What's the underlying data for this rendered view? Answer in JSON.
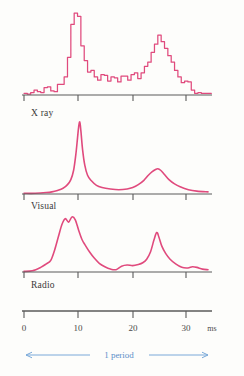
{
  "figure": {
    "curve_color": "#e04a7d",
    "axis_color": "#5a5a5a",
    "period_color": "#7aa9d9",
    "background": "#fdfdfb"
  },
  "axis": {
    "unit_label": "ms",
    "tick_labels": [
      "0",
      "10",
      "20",
      "30"
    ],
    "tick_values": [
      0,
      10,
      20,
      30
    ],
    "min": 0,
    "max": 33
  },
  "period": {
    "label": "1 period",
    "start_ms": 0,
    "end_ms": 33
  },
  "panels": [
    {
      "label": "X ray",
      "style": "step"
    },
    {
      "label": "Visual",
      "style": "smooth"
    },
    {
      "label": "Radio",
      "style": "smooth"
    }
  ],
  "chart_data": {
    "type": "line",
    "xlabel": "ms",
    "ylabel": "",
    "xlim": [
      0,
      33
    ],
    "grid": false,
    "legend": "none",
    "annotations": [
      "1 period"
    ],
    "series": [
      {
        "name": "X ray",
        "plot_style": "step",
        "x": [
          0,
          0.6,
          1.2,
          1.8,
          2.4,
          3.0,
          3.6,
          4.2,
          4.8,
          5.4,
          6.0,
          6.6,
          7.2,
          7.8,
          8.4,
          9.0,
          9.6,
          10.2,
          10.8,
          11.4,
          12.0,
          12.6,
          13.2,
          13.8,
          14.4,
          15.0,
          15.6,
          16.2,
          16.8,
          17.4,
          18.0,
          18.6,
          19.2,
          19.8,
          20.4,
          21.0,
          21.6,
          22.2,
          22.8,
          23.4,
          24.0,
          24.6,
          25.2,
          25.8,
          26.4,
          27.0,
          27.6,
          28.2,
          28.8,
          29.4,
          30.0,
          30.6,
          31.2,
          31.8,
          32.4,
          33.0
        ],
        "y": [
          2,
          1,
          3,
          6,
          4,
          3,
          9,
          10,
          5,
          4,
          13,
          13,
          22,
          46,
          86,
          100,
          96,
          60,
          42,
          28,
          30,
          22,
          18,
          25,
          24,
          17,
          22,
          21,
          16,
          23,
          23,
          18,
          25,
          27,
          20,
          27,
          35,
          40,
          52,
          62,
          73,
          65,
          57,
          48,
          40,
          30,
          22,
          15,
          17,
          16,
          6,
          2,
          3,
          2,
          2,
          2
        ]
      },
      {
        "name": "Visual",
        "plot_style": "smooth",
        "x": [
          0,
          2,
          4,
          5,
          6,
          7,
          7.8,
          8.4,
          8.9,
          9.3,
          9.6,
          9.8,
          10.0,
          10.2,
          10.5,
          10.9,
          11.4,
          12.0,
          13.0,
          14.0,
          15.5,
          17.0,
          18.5,
          19.5,
          20.5,
          21.5,
          22.3,
          23.0,
          23.6,
          24.0,
          24.5,
          25.2,
          26.0,
          27.0,
          28.0,
          29.5,
          31.0,
          33.0
        ],
        "y": [
          1,
          1,
          2,
          3,
          5,
          8,
          13,
          20,
          33,
          55,
          78,
          93,
          100,
          88,
          62,
          40,
          26,
          19,
          12,
          9,
          7,
          6,
          7,
          9,
          13,
          19,
          26,
          31,
          34,
          35,
          33,
          27,
          20,
          14,
          10,
          6,
          4,
          3
        ]
      },
      {
        "name": "Radio",
        "plot_style": "smooth",
        "x": [
          0,
          1.5,
          3.0,
          4.0,
          4.8,
          5.5,
          6.2,
          6.8,
          7.4,
          8.0,
          8.6,
          9.2,
          9.8,
          10.4,
          11.0,
          11.8,
          12.6,
          13.5,
          14.5,
          15.5,
          16.5,
          17.5,
          18.5,
          19.5,
          20.5,
          21.3,
          22.0,
          22.7,
          23.3,
          23.8,
          24.2,
          24.7,
          25.4,
          26.2,
          27.2,
          28.3,
          29.4,
          30.2,
          31.0,
          32.0,
          33.0
        ],
        "y": [
          1,
          2,
          8,
          14,
          20,
          38,
          62,
          82,
          92,
          86,
          95,
          90,
          72,
          56,
          46,
          34,
          24,
          15,
          9,
          5,
          4,
          10,
          12,
          11,
          13,
          16,
          22,
          35,
          55,
          68,
          60,
          45,
          32,
          22,
          14,
          8,
          7,
          9,
          8,
          5,
          4
        ]
      }
    ]
  }
}
